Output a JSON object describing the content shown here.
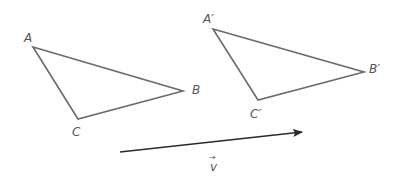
{
  "diagram": {
    "type": "translation",
    "stroke_color": "#6b6b6b",
    "arrow_color": "#2a2a2a",
    "triangle_original": {
      "vertices": {
        "A": {
          "label": "A",
          "x": 33,
          "y": 47
        },
        "B": {
          "label": "B",
          "x": 183,
          "y": 91
        },
        "C": {
          "label": "C",
          "x": 78,
          "y": 119
        }
      }
    },
    "triangle_image": {
      "vertices": {
        "A": {
          "label": "A′",
          "x": 213,
          "y": 29
        },
        "B": {
          "label": "B′",
          "x": 364,
          "y": 72
        },
        "C": {
          "label": "C′",
          "x": 258,
          "y": 100
        }
      }
    },
    "vector": {
      "label": "v",
      "arrow_glyph": "→",
      "start": {
        "x": 120,
        "y": 152
      },
      "end": {
        "x": 302,
        "y": 132
      }
    }
  }
}
